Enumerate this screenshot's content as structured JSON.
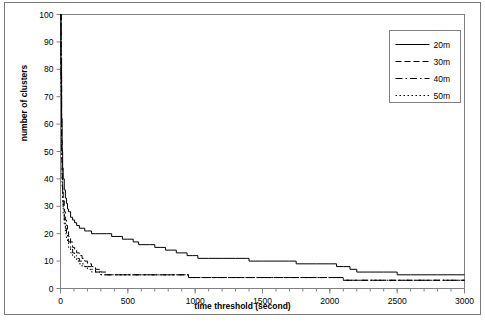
{
  "chart_data": {
    "type": "line",
    "title": "",
    "xlabel": "time threshold (second)",
    "ylabel": "number of clusters",
    "xlim": [
      0,
      3000
    ],
    "ylim": [
      0,
      100
    ],
    "xticks": [
      0,
      500,
      1000,
      1500,
      2000,
      2500,
      3000
    ],
    "yticks": [
      0,
      10,
      20,
      30,
      40,
      50,
      60,
      70,
      80,
      90,
      100
    ],
    "xtick_labels": [
      "0",
      "500",
      "1000",
      "1500",
      "2000",
      "2500",
      "3000"
    ],
    "ytick_labels": [
      "0",
      "10",
      "20",
      "30",
      "40",
      "50",
      "60",
      "70",
      "80",
      "90",
      "100"
    ],
    "x_minor_tick_interval": 100,
    "grid": false,
    "legend_position": "top-right",
    "legend_entries": [
      "20m",
      "30m",
      "40m",
      "50m"
    ],
    "series": [
      {
        "name": "20m",
        "style": "solid",
        "color": "#000000",
        "points": [
          [
            0,
            100
          ],
          [
            4,
            84
          ],
          [
            8,
            62
          ],
          [
            12,
            50
          ],
          [
            16,
            44
          ],
          [
            20,
            40
          ],
          [
            28,
            36
          ],
          [
            36,
            33
          ],
          [
            44,
            31
          ],
          [
            52,
            29
          ],
          [
            60,
            28
          ],
          [
            75,
            26
          ],
          [
            90,
            25
          ],
          [
            105,
            24
          ],
          [
            120,
            23
          ],
          [
            140,
            22
          ],
          [
            160,
            22
          ],
          [
            180,
            21
          ],
          [
            200,
            21
          ],
          [
            230,
            20
          ],
          [
            260,
            20
          ],
          [
            300,
            20
          ],
          [
            340,
            20
          ],
          [
            380,
            19
          ],
          [
            420,
            19
          ],
          [
            460,
            18
          ],
          [
            500,
            18
          ],
          [
            540,
            17
          ],
          [
            560,
            17
          ],
          [
            580,
            16
          ],
          [
            620,
            16
          ],
          [
            660,
            16
          ],
          [
            700,
            15
          ],
          [
            740,
            15
          ],
          [
            780,
            14
          ],
          [
            820,
            14
          ],
          [
            860,
            13
          ],
          [
            900,
            13
          ],
          [
            940,
            12
          ],
          [
            980,
            12
          ],
          [
            1020,
            11
          ],
          [
            1100,
            11
          ],
          [
            1200,
            11
          ],
          [
            1300,
            11
          ],
          [
            1380,
            11
          ],
          [
            1400,
            10
          ],
          [
            1500,
            10
          ],
          [
            1600,
            10
          ],
          [
            1700,
            10
          ],
          [
            1750,
            9
          ],
          [
            1800,
            9
          ],
          [
            1900,
            9
          ],
          [
            2000,
            9
          ],
          [
            2050,
            8
          ],
          [
            2100,
            8
          ],
          [
            2150,
            7
          ],
          [
            2200,
            6
          ],
          [
            2300,
            6
          ],
          [
            2400,
            6
          ],
          [
            2500,
            5
          ],
          [
            2600,
            5
          ],
          [
            2800,
            5
          ],
          [
            3000,
            5
          ]
        ]
      },
      {
        "name": "30m",
        "style": "dashed",
        "color": "#000000",
        "points": [
          [
            0,
            100
          ],
          [
            4,
            78
          ],
          [
            8,
            54
          ],
          [
            12,
            42
          ],
          [
            16,
            36
          ],
          [
            20,
            32
          ],
          [
            28,
            28
          ],
          [
            36,
            25
          ],
          [
            44,
            23
          ],
          [
            52,
            21
          ],
          [
            60,
            19
          ],
          [
            75,
            17
          ],
          [
            90,
            15
          ],
          [
            105,
            14
          ],
          [
            120,
            13
          ],
          [
            140,
            12
          ],
          [
            160,
            11
          ],
          [
            180,
            10
          ],
          [
            200,
            9
          ],
          [
            230,
            8
          ],
          [
            260,
            7
          ],
          [
            300,
            6
          ],
          [
            340,
            5
          ],
          [
            380,
            5
          ],
          [
            420,
            5
          ],
          [
            500,
            5
          ],
          [
            600,
            5
          ],
          [
            700,
            5
          ],
          [
            800,
            5
          ],
          [
            900,
            5
          ],
          [
            950,
            4
          ],
          [
            1000,
            4
          ],
          [
            1200,
            4
          ],
          [
            1400,
            4
          ],
          [
            1600,
            4
          ],
          [
            1800,
            4
          ],
          [
            2000,
            4
          ],
          [
            2100,
            3
          ],
          [
            2200,
            3
          ],
          [
            2400,
            3
          ],
          [
            2600,
            3
          ],
          [
            2800,
            3
          ],
          [
            3000,
            3
          ]
        ]
      },
      {
        "name": "40m",
        "style": "dashdot",
        "color": "#000000",
        "points": [
          [
            0,
            100
          ],
          [
            4,
            74
          ],
          [
            8,
            50
          ],
          [
            12,
            39
          ],
          [
            16,
            33
          ],
          [
            20,
            29
          ],
          [
            28,
            25
          ],
          [
            36,
            22
          ],
          [
            44,
            20
          ],
          [
            52,
            18
          ],
          [
            60,
            17
          ],
          [
            75,
            15
          ],
          [
            90,
            13
          ],
          [
            105,
            12
          ],
          [
            120,
            11
          ],
          [
            140,
            10
          ],
          [
            160,
            9
          ],
          [
            180,
            8
          ],
          [
            200,
            8
          ],
          [
            230,
            7
          ],
          [
            260,
            6
          ],
          [
            300,
            5
          ],
          [
            340,
            5
          ],
          [
            400,
            5
          ],
          [
            500,
            5
          ],
          [
            600,
            5
          ],
          [
            700,
            5
          ],
          [
            800,
            5
          ],
          [
            900,
            5
          ],
          [
            950,
            4
          ],
          [
            1000,
            4
          ],
          [
            1300,
            4
          ],
          [
            1600,
            4
          ],
          [
            1900,
            4
          ],
          [
            2100,
            3
          ],
          [
            2400,
            3
          ],
          [
            2700,
            3
          ],
          [
            3000,
            3
          ]
        ]
      },
      {
        "name": "50m",
        "style": "dotted",
        "color": "#000000",
        "points": [
          [
            0,
            100
          ],
          [
            4,
            70
          ],
          [
            8,
            47
          ],
          [
            12,
            37
          ],
          [
            16,
            31
          ],
          [
            20,
            27
          ],
          [
            28,
            23
          ],
          [
            36,
            20
          ],
          [
            44,
            18
          ],
          [
            52,
            17
          ],
          [
            60,
            15
          ],
          [
            75,
            13
          ],
          [
            90,
            12
          ],
          [
            105,
            11
          ],
          [
            120,
            10
          ],
          [
            140,
            9
          ],
          [
            160,
            8
          ],
          [
            180,
            8
          ],
          [
            200,
            7
          ],
          [
            230,
            6
          ],
          [
            260,
            6
          ],
          [
            300,
            5
          ],
          [
            350,
            5
          ],
          [
            450,
            5
          ],
          [
            550,
            5
          ],
          [
            700,
            5
          ],
          [
            850,
            5
          ],
          [
            950,
            4
          ],
          [
            1100,
            4
          ],
          [
            1400,
            4
          ],
          [
            1700,
            4
          ],
          [
            2000,
            4
          ],
          [
            2100,
            3
          ],
          [
            2500,
            3
          ],
          [
            2800,
            3
          ],
          [
            3000,
            3
          ]
        ]
      }
    ]
  },
  "axes": {
    "x_title": "time threshold (second)",
    "y_title": "number of clusters"
  }
}
